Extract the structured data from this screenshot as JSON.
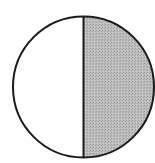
{
  "diagram": {
    "type": "half-shaded-circle",
    "fraction_shaded": "1/2",
    "colors": {
      "background": "#ffffff",
      "outline": "#1a1a1a",
      "unshaded": "#ffffff",
      "shaded": "#b4b4b4"
    },
    "halves": [
      {
        "side": "left",
        "shaded": false
      },
      {
        "side": "right",
        "shaded": true
      }
    ]
  }
}
